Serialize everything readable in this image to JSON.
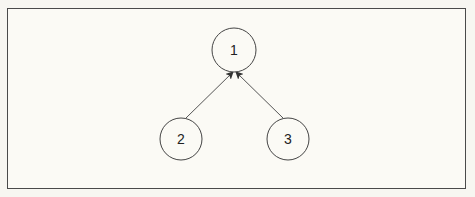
{
  "diagram": {
    "type": "tree",
    "nodes": [
      {
        "id": "1",
        "label": "1",
        "cx": 234,
        "cy": 50,
        "r": 22
      },
      {
        "id": "2",
        "label": "2",
        "cx": 181,
        "cy": 139,
        "r": 21
      },
      {
        "id": "3",
        "label": "3",
        "cx": 288,
        "cy": 139,
        "r": 21
      }
    ],
    "edges": [
      {
        "from": "2",
        "to": "1",
        "directed": true
      },
      {
        "from": "3",
        "to": "1",
        "directed": true
      }
    ],
    "colors": {
      "stroke": "#4a4a4a",
      "background": "#fbfaf5",
      "text": "#222222"
    }
  }
}
